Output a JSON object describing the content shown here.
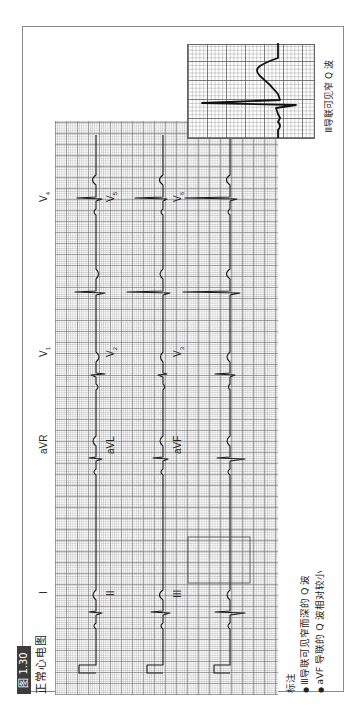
{
  "figure": {
    "number_label": "图 1.30",
    "title": "正常心电图"
  },
  "ecg": {
    "leads": {
      "row1": [
        "I",
        "aVR",
        "V1",
        "V4"
      ],
      "row2": [
        "II",
        "aVL",
        "V2",
        "V5"
      ],
      "row3": [
        "III",
        "aVF",
        "V3",
        "V6"
      ]
    },
    "labels": {
      "I": "I",
      "II": "II",
      "III": "III",
      "aVR": "aVR",
      "aVL": "aVL",
      "aVF": "aVF",
      "V": "V",
      "V1": "1",
      "V2": "2",
      "V3": "3",
      "V4": "4",
      "V5": "5",
      "V6": "6"
    },
    "highlight_box": "lead III QRS complex",
    "colors": {
      "trace": "#1a1a1a",
      "grid": "#8c8c8c",
      "badge": "#3c3c3c"
    }
  },
  "notes": {
    "heading": "标注",
    "items": [
      "Ⅲ导联可见窄而深的 Q 波",
      "aVF 导联的 Q 波相对较小"
    ]
  },
  "inset": {
    "caption": "Ⅲ导联可见窄 Q 波"
  }
}
